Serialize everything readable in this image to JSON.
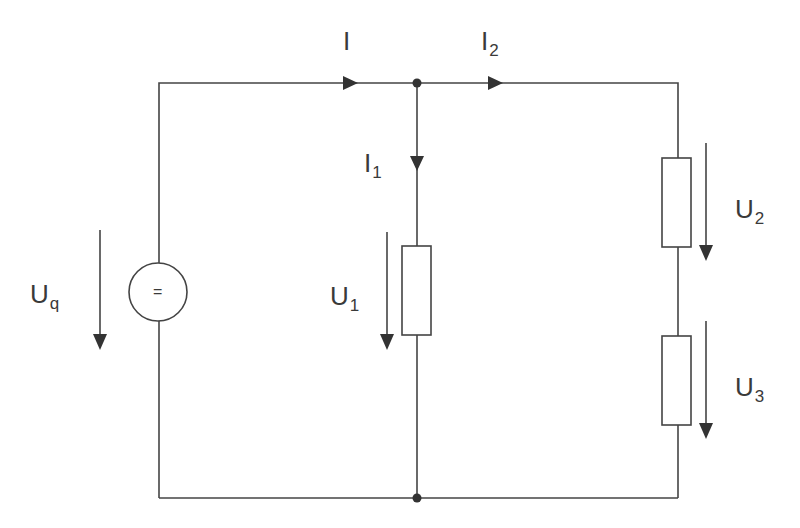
{
  "diagram": {
    "type": "electrical circuit schematic",
    "colors": {
      "line": "#444444",
      "text": "#3a3a3a",
      "background": "#ffffff"
    },
    "source": {
      "symbol": "=",
      "label": {
        "main": "U",
        "sub": "q"
      }
    },
    "resistors": [
      {
        "id": "R1",
        "voltage_label": {
          "main": "U",
          "sub": "1"
        }
      },
      {
        "id": "R2",
        "voltage_label": {
          "main": "U",
          "sub": "2"
        }
      },
      {
        "id": "R3",
        "voltage_label": {
          "main": "U",
          "sub": "3"
        }
      }
    ],
    "currents": [
      {
        "id": "I",
        "label": {
          "main": "I",
          "sub": ""
        }
      },
      {
        "id": "I1",
        "label": {
          "main": "I",
          "sub": "1"
        }
      },
      {
        "id": "I2",
        "label": {
          "main": "I",
          "sub": "2"
        }
      }
    ]
  }
}
